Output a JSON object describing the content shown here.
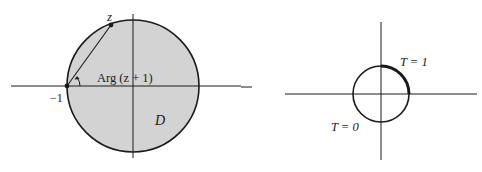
{
  "figures": {
    "left": {
      "region_label": "D",
      "point_z_label": "z",
      "point_minus_one_label": "−1",
      "angle_label": "Arg (z + 1)",
      "colors": {
        "fill": "#d3d3d3",
        "stroke": "#1a1a1a"
      }
    },
    "right": {
      "label_t1": "T = 1",
      "label_t0": "T = 0",
      "colors": {
        "stroke": "#1a1a1a"
      }
    }
  }
}
